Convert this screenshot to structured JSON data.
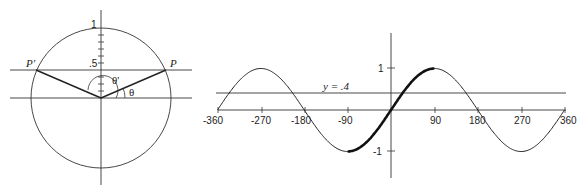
{
  "unit_circle": {
    "y_axis_label_top": "1",
    "y_axis_label_half": ".5",
    "point_right": "P",
    "point_left": "P'",
    "angle_theta": "θ",
    "angle_theta_prime": "θ'",
    "horizontal_line_value": 0.4
  },
  "chart_data": {
    "type": "line",
    "title": "",
    "function": "y = sin(x)",
    "xlabel": "",
    "ylabel": "",
    "x_ticks": [
      -360,
      -270,
      -180,
      -90,
      90,
      180,
      270,
      360
    ],
    "x_tick_labels": [
      "-360",
      "-270",
      "-180",
      "-90",
      "90",
      "180",
      "270",
      "360"
    ],
    "y_ticks": [
      1,
      -1
    ],
    "y_tick_labels": [
      "1",
      "-1"
    ],
    "xlim": [
      -360,
      360
    ],
    "ylim": [
      -1,
      1
    ],
    "highlighted_segment_x": [
      -90,
      90
    ],
    "reference_line": {
      "y": 0.4,
      "label": "y = .4"
    },
    "series": [
      {
        "name": "sin x",
        "x": [
          -360,
          -270,
          -180,
          -90,
          0,
          90,
          180,
          270,
          360
        ],
        "values": [
          0,
          1,
          0,
          -1,
          0,
          1,
          0,
          -1,
          0
        ]
      }
    ],
    "grid": false
  }
}
